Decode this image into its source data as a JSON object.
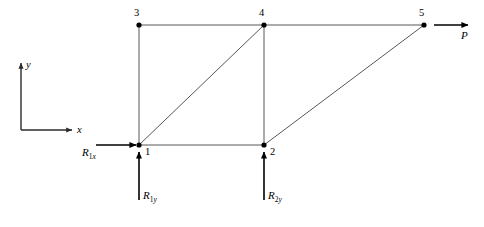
{
  "figure": {
    "type": "truss-free-body-diagram"
  },
  "axes": {
    "x_label": "x",
    "y_label": "y",
    "origin": {
      "x": 21,
      "y": 130
    },
    "x_tip": {
      "x": 72,
      "y": 130
    },
    "y_tip": {
      "x": 21,
      "y": 63
    }
  },
  "nodes": [
    {
      "id": "1",
      "label": "1",
      "x": 139,
      "y": 145,
      "label_x": 145,
      "label_y": 147
    },
    {
      "id": "2",
      "label": "2",
      "x": 264,
      "y": 145,
      "label_x": 270,
      "label_y": 147
    },
    {
      "id": "3",
      "label": "3",
      "x": 139,
      "y": 25,
      "label_x": 134,
      "label_y": 8
    },
    {
      "id": "4",
      "label": "4",
      "x": 264,
      "y": 25,
      "label_x": 259,
      "label_y": 8
    },
    {
      "id": "5",
      "label": "5",
      "x": 424,
      "y": 25,
      "label_x": 419,
      "label_y": 8
    }
  ],
  "members": [
    {
      "from": "3",
      "to": "4",
      "kind": "top-chord"
    },
    {
      "from": "4",
      "to": "5",
      "kind": "top-chord"
    },
    {
      "from": "1",
      "to": "2",
      "kind": "bottom-chord"
    },
    {
      "from": "1",
      "to": "3",
      "kind": "vertical"
    },
    {
      "from": "2",
      "to": "4",
      "kind": "vertical"
    },
    {
      "from": "1",
      "to": "4",
      "kind": "diagonal"
    },
    {
      "from": "2",
      "to": "5",
      "kind": "diagonal"
    }
  ],
  "forces": [
    {
      "name": "applied-load-p",
      "symbol": "P",
      "subscript": "",
      "direction": "right",
      "at_node": "5",
      "tail": {
        "x": 434,
        "y": 25
      },
      "head": {
        "x": 468,
        "y": 25
      },
      "label_x": 461,
      "label_y": 30
    },
    {
      "name": "reaction-r1x",
      "symbol": "R",
      "subscript": "1x",
      "direction": "right",
      "at_node": "1",
      "tail": {
        "x": 96,
        "y": 145
      },
      "head": {
        "x": 136,
        "y": 145
      },
      "label_x": 82,
      "label_y": 147
    },
    {
      "name": "reaction-r1y",
      "symbol": "R",
      "subscript": "1y",
      "direction": "up",
      "at_node": "1",
      "tail": {
        "x": 139,
        "y": 200
      },
      "head": {
        "x": 139,
        "y": 152
      },
      "label_x": 143,
      "label_y": 190
    },
    {
      "name": "reaction-r2y",
      "symbol": "R",
      "subscript": "2y",
      "direction": "up",
      "at_node": "2",
      "tail": {
        "x": 264,
        "y": 200
      },
      "head": {
        "x": 264,
        "y": 152
      },
      "label_x": 268,
      "label_y": 190
    }
  ],
  "style": {
    "member_color": "#585858",
    "member_width": 1,
    "force_color": "#000000",
    "force_width": 1.6,
    "axis_color": "#2b2b2b",
    "axis_width": 1.4,
    "node_color": "#000000",
    "node_radius": 2.6
  }
}
